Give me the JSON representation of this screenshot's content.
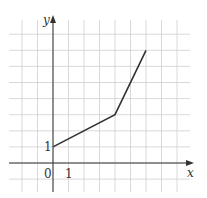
{
  "chart_data": {
    "type": "line",
    "title": "",
    "xlabel": "x",
    "ylabel": "y",
    "x": [
      0,
      4,
      6
    ],
    "series": [
      {
        "name": "f",
        "values": [
          1,
          3,
          7
        ]
      }
    ],
    "xlim": [
      -3,
      8.5
    ],
    "ylim": [
      -1.5,
      8.8
    ],
    "grid": true,
    "tick_labels": {
      "origin": "0",
      "x": "1",
      "y": "1"
    },
    "colors": {
      "line": "#333333",
      "grid": "#cccccc",
      "axis": "#333333"
    }
  }
}
